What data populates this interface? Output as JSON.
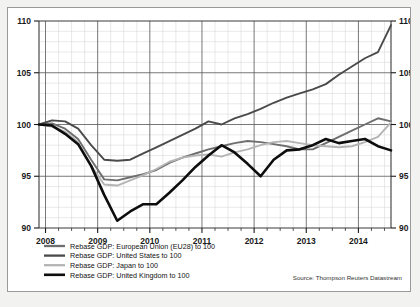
{
  "source_note": "Source: Thompson Reuters Datastream",
  "legend": {
    "items": [
      {
        "label": "Rebase GDP: European Union (EU28) to 100",
        "color": "#6e6e6e",
        "width": 1.9,
        "name": "legend-item-eu28"
      },
      {
        "label": "Rebase GDP: United States to 100",
        "color": "#4a4a4a",
        "width": 1.9,
        "name": "legend-item-united-states"
      },
      {
        "label": "Rebase GDP: Japan to 100",
        "color": "#b4b4b4",
        "width": 1.9,
        "name": "legend-item-japan"
      },
      {
        "label": "Rebase GDP: United Kingdom to 100",
        "color": "#0d0d0d",
        "width": 2.6,
        "name": "legend-item-united-kingdom"
      }
    ]
  },
  "chart_data": {
    "type": "line",
    "title": "",
    "xlabel": "",
    "ylabel": "",
    "ylim": [
      90,
      110
    ],
    "ytick_values": [
      90,
      95,
      100,
      105,
      110
    ],
    "ytick_labels": [
      "90",
      "95",
      "100",
      "105",
      "110"
    ],
    "y_minor_step": 1,
    "y_axis_both_sides": true,
    "xlim": [
      2007.875,
      2014.625
    ],
    "xtick_values": [
      2008,
      2009,
      2010,
      2011,
      2012,
      2013,
      2014
    ],
    "xtick_labels": [
      "2008",
      "2009",
      "2010",
      "2011",
      "2012",
      "2013",
      "2014"
    ],
    "x_minor_step": 0.25,
    "grid": true,
    "legend_position": "below-axes-left",
    "x": [
      2007.875,
      2008.125,
      2008.375,
      2008.625,
      2008.875,
      2009.125,
      2009.375,
      2009.625,
      2009.875,
      2010.125,
      2010.375,
      2010.625,
      2010.875,
      2011.125,
      2011.375,
      2011.625,
      2011.875,
      2012.125,
      2012.375,
      2012.625,
      2012.875,
      2013.125,
      2013.375,
      2013.625,
      2013.875,
      2014.125,
      2014.375,
      2014.625
    ],
    "series": [
      {
        "name": "Rebase GDP: European Union (EU28) to 100",
        "color": "#6e6e6e",
        "width": 1.9,
        "values": [
          100.0,
          100.1,
          99.6,
          98.6,
          96.6,
          94.7,
          94.6,
          94.9,
          95.2,
          95.6,
          96.3,
          96.8,
          97.2,
          97.6,
          97.9,
          98.2,
          98.4,
          98.3,
          98.1,
          97.9,
          97.6,
          97.6,
          98.2,
          98.8,
          99.4,
          100.0,
          100.6,
          100.3
        ]
      },
      {
        "name": "Rebase GDP: United States to 100",
        "color": "#4a4a4a",
        "width": 1.9,
        "values": [
          100.0,
          100.4,
          100.3,
          99.6,
          98.0,
          96.6,
          96.5,
          96.6,
          97.2,
          97.8,
          98.4,
          99.0,
          99.6,
          100.3,
          100.0,
          100.6,
          101.0,
          101.5,
          102.1,
          102.6,
          103.0,
          103.4,
          103.9,
          104.8,
          105.6,
          106.4,
          107.0,
          109.6
        ]
      },
      {
        "name": "Rebase GDP: Japan to 100",
        "color": "#b4b4b4",
        "width": 1.9,
        "values": [
          100.0,
          99.8,
          99.3,
          98.3,
          96.0,
          94.2,
          94.1,
          94.6,
          95.1,
          95.7,
          96.4,
          96.8,
          97.0,
          97.1,
          96.9,
          97.3,
          97.6,
          98.0,
          98.3,
          98.4,
          98.2,
          98.0,
          97.9,
          97.8,
          97.9,
          98.3,
          98.8,
          100.2
        ]
      },
      {
        "name": "Rebase GDP: United Kingdom to 100",
        "color": "#0d0d0d",
        "width": 2.6,
        "values": [
          100.0,
          99.9,
          99.1,
          98.1,
          96.0,
          93.2,
          90.7,
          91.6,
          92.3,
          92.3,
          93.4,
          94.6,
          95.9,
          97.0,
          98.0,
          97.3,
          96.2,
          95.0,
          96.6,
          97.5,
          97.6,
          98.0,
          98.6,
          98.2,
          98.4,
          98.6,
          97.9,
          97.5
        ]
      }
    ]
  }
}
